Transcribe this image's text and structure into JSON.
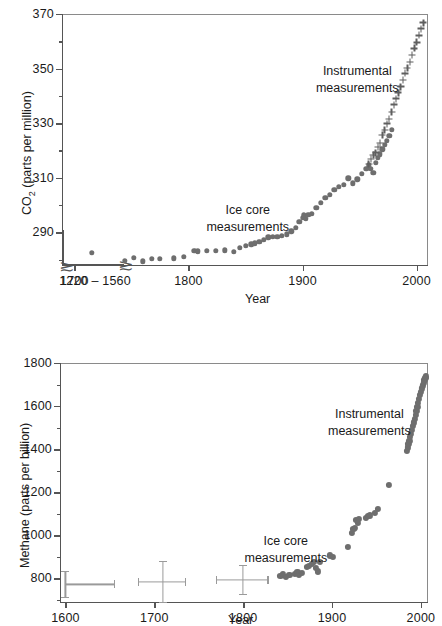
{
  "figure": {
    "marker_color": "#6e6e6e",
    "axis_color": "#555555"
  },
  "chart_data": [
    {
      "type": "scatter",
      "id": "co2",
      "title": "",
      "xlabel": "Year",
      "ylabel": "CO2 (parts per million)",
      "ylabel_prefix": "CO",
      "ylabel_sub": "2",
      "ylabel_suffix": " (parts per million)",
      "xlim": [
        1690,
        2010
      ],
      "ylim": [
        278,
        370
      ],
      "yticks": [
        290,
        310,
        330,
        350,
        370
      ],
      "yticks_minor": [
        280,
        300,
        320,
        340,
        360
      ],
      "xticks": [
        1700,
        1800,
        1900,
        2000
      ],
      "grid": false,
      "axis_break": true,
      "inset_segment_label": "1220 – 1560",
      "inset_points": [
        {
          "x": 1350,
          "y": 283.5
        }
      ],
      "annotations": [
        {
          "text": "Instrumental",
          "text2": "measurements",
          "x": 1948,
          "y": 352
        },
        {
          "text": "Ice core",
          "text2": "measurements",
          "x": 1852,
          "y": 301
        }
      ],
      "series": [
        {
          "name": "Ice core measurements",
          "marker": "circle",
          "points": [
            [
              1744,
              279.6
            ],
            [
              1752,
              280.6
            ],
            [
              1760,
              279.4
            ],
            [
              1768,
              280.2
            ],
            [
              1775,
              280.3
            ],
            [
              1787,
              280.4
            ],
            [
              1796,
              280.9
            ],
            [
              1805,
              283.2
            ],
            [
              1808,
              283.0
            ],
            [
              1816,
              283.2
            ],
            [
              1824,
              283.3
            ],
            [
              1832,
              283.4
            ],
            [
              1840,
              282.8
            ],
            [
              1845,
              284.4
            ],
            [
              1850,
              285.1
            ],
            [
              1855,
              285.6
            ],
            [
              1858,
              286.0
            ],
            [
              1862,
              286.4
            ],
            [
              1866,
              287.3
            ],
            [
              1870,
              288.2
            ],
            [
              1874,
              288.4
            ],
            [
              1878,
              288.3
            ],
            [
              1882,
              288.6
            ],
            [
              1886,
              289.3
            ],
            [
              1890,
              290.4
            ],
            [
              1894,
              291.6
            ],
            [
              1897,
              293.8
            ],
            [
              1900,
              295.4
            ],
            [
              1901,
              296.2
            ],
            [
              1903,
              295.0
            ],
            [
              1905,
              296.3
            ],
            [
              1908,
              296.8
            ],
            [
              1912,
              299.0
            ],
            [
              1916,
              300.8
            ],
            [
              1920,
              302.6
            ],
            [
              1924,
              303.8
            ],
            [
              1928,
              305.6
            ],
            [
              1932,
              306.6
            ],
            [
              1936,
              307.4
            ],
            [
              1940,
              309.8
            ],
            [
              1944,
              308.0
            ],
            [
              1948,
              309.4
            ],
            [
              1952,
              311.4
            ],
            [
              1956,
              313.2
            ],
            [
              1958,
              314.6
            ],
            [
              1960,
              313.2
            ],
            [
              1962,
              311.8
            ],
            [
              1964,
              315.4
            ],
            [
              1966,
              317.4
            ],
            [
              1968,
              318.6
            ],
            [
              1970,
              320.4
            ],
            [
              1972,
              322.0
            ],
            [
              1974,
              323.6
            ],
            [
              1976,
              325.4
            ],
            [
              1978,
              327.6
            ]
          ]
        },
        {
          "name": "Instrumental measurements",
          "marker": "cross",
          "points": [
            [
              1958,
              315.0
            ],
            [
              1960,
              316.8
            ],
            [
              1962,
              318.4
            ],
            [
              1964,
              319.2
            ],
            [
              1966,
              321.2
            ],
            [
              1968,
              322.8
            ],
            [
              1970,
              325.6
            ],
            [
              1972,
              327.4
            ],
            [
              1974,
              329.8
            ],
            [
              1976,
              331.6
            ],
            [
              1978,
              334.0
            ],
            [
              1980,
              336.8
            ],
            [
              1982,
              339.0
            ],
            [
              1984,
              341.2
            ],
            [
              1986,
              343.4
            ],
            [
              1988,
              345.8
            ],
            [
              1990,
              348.2
            ],
            [
              1992,
              350.2
            ],
            [
              1994,
              352.4
            ],
            [
              1996,
              355.0
            ],
            [
              1998,
              357.4
            ],
            [
              2000,
              359.6
            ],
            [
              2002,
              362.2
            ],
            [
              2004,
              364.6
            ],
            [
              2006,
              366.8
            ]
          ]
        }
      ]
    },
    {
      "type": "scatter",
      "id": "methane",
      "title": "",
      "xlabel": "Year",
      "ylabel": "Methane (parts per billion)",
      "xlim": [
        1595,
        2008
      ],
      "ylim": [
        690,
        1800
      ],
      "yticks": [
        800,
        1000,
        1200,
        1400,
        1600,
        1800
      ],
      "yticks_minor": [
        700,
        900,
        1100,
        1300,
        1500,
        1700
      ],
      "xticks": [
        1600,
        1700,
        1800,
        1900,
        2000
      ],
      "grid": false,
      "annotations": [
        {
          "text": "Instrumental",
          "text2": "measurements",
          "x": 1942,
          "y": 1600
        },
        {
          "text": "Ice core",
          "text2": "measurements",
          "x": 1848,
          "y": 1010
        }
      ],
      "error_bars": [
        {
          "x": 1600,
          "y": 772,
          "xerr_low": 0,
          "xerr_high": 55,
          "yerr": 60
        },
        {
          "x": 1710,
          "y": 783,
          "xerr_low": 28,
          "xerr_high": 25,
          "yerr": 95
        },
        {
          "x": 1800,
          "y": 793,
          "xerr_low": 30,
          "xerr_high": 28,
          "yerr": 68
        }
      ],
      "series": [
        {
          "name": "Ice core measurements",
          "marker": "circle",
          "points": [
            [
              1842,
              812
            ],
            [
              1845,
              818
            ],
            [
              1848,
              808
            ],
            [
              1852,
              815
            ],
            [
              1858,
              822
            ],
            [
              1861,
              828
            ],
            [
              1863,
              818
            ],
            [
              1866,
              826
            ],
            [
              1872,
              852
            ],
            [
              1874,
              858
            ],
            [
              1877,
              866
            ],
            [
              1880,
              878
            ],
            [
              1882,
              848
            ],
            [
              1884,
              832
            ],
            [
              1886,
              876
            ],
            [
              1898,
              906
            ],
            [
              1901,
              900
            ],
            [
              1918,
              944
            ],
            [
              1922,
              1012
            ],
            [
              1924,
              1028
            ],
            [
              1926,
              1036
            ],
            [
              1927,
              1070
            ],
            [
              1929,
              1058
            ],
            [
              1930,
              1076
            ],
            [
              1938,
              1082
            ],
            [
              1940,
              1088
            ],
            [
              1943,
              1092
            ],
            [
              1948,
              1104
            ],
            [
              1952,
              1122
            ],
            [
              1964,
              1234
            ]
          ]
        },
        {
          "name": "Instrumental measurements",
          "marker": "circle",
          "points": [
            [
              1984,
              1392
            ],
            [
              1985,
              1408
            ],
            [
              1986,
              1424
            ],
            [
              1987,
              1440
            ],
            [
              1988,
              1456
            ],
            [
              1989,
              1472
            ],
            [
              1990,
              1488
            ],
            [
              1991,
              1506
            ],
            [
              1992,
              1524
            ],
            [
              1993,
              1542
            ],
            [
              1994,
              1560
            ],
            [
              1995,
              1578
            ],
            [
              1996,
              1596
            ],
            [
              1997,
              1614
            ],
            [
              1998,
              1632
            ],
            [
              1999,
              1650
            ],
            [
              2000,
              1666
            ],
            [
              2001,
              1682
            ],
            [
              2002,
              1696
            ],
            [
              2003,
              1710
            ],
            [
              2004,
              1722
            ],
            [
              2005,
              1732
            ],
            [
              2006,
              1738
            ]
          ]
        }
      ]
    }
  ]
}
